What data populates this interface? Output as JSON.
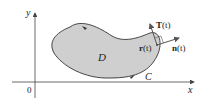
{
  "diagram": {
    "type": "region-with-boundary-curve",
    "axes": {
      "x_label": "x",
      "y_label": "y",
      "origin_label": "0"
    },
    "region": {
      "label": "D",
      "fill_color": "#cfcfcf",
      "stroke_color": "#333333"
    },
    "curve": {
      "label": "C",
      "orientation": "counterclockwise"
    },
    "vectors": {
      "position": {
        "label_bold": "r",
        "label_arg": "(t)"
      },
      "tangent": {
        "label_bold": "T",
        "label_arg": "(t)"
      },
      "normal": {
        "label_bold": "n",
        "label_arg": "(t)"
      }
    },
    "colors": {
      "axis": "#444444",
      "text": "#222222"
    }
  }
}
